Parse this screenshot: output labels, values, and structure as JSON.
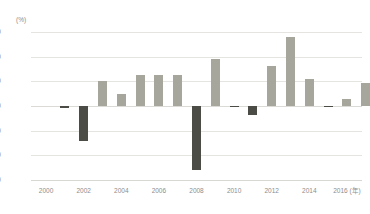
{
  "chart_data": {
    "type": "bar",
    "title": "",
    "subtitle": "",
    "xlabel": "(年)",
    "ylabel": "(%)",
    "ylim": [
      -60,
      60
    ],
    "yticks": [
      60,
      40,
      20,
      0,
      -20,
      -40,
      -60
    ],
    "ytick_labels": [
      "60",
      "40",
      "20",
      "0",
      "-20",
      "-40",
      "-60"
    ],
    "xticks": [
      "2000",
      "2002",
      "2004",
      "2006",
      "2008",
      "2010",
      "2012",
      "2014",
      "2016"
    ],
    "xtick_suffix": "(年)",
    "grid": true,
    "legend": "none",
    "categories": [
      "2000",
      "2001",
      "2002",
      "2003",
      "2004",
      "2005",
      "2006",
      "2007",
      "2008",
      "2009",
      "2010",
      "2011",
      "2012",
      "2013",
      "2014",
      "2015",
      "2016"
    ],
    "values": [
      0,
      -1.5,
      -28,
      20,
      10,
      25,
      25,
      25.5,
      -52,
      38,
      -1,
      -7.5,
      32.5,
      56,
      22,
      -0.5,
      6
    ],
    "values_extra": [
      19
    ],
    "colors": {
      "positive": "#a6a69c",
      "negative": "#4c4c46",
      "gridline": "#e6e4e0",
      "axis": "#d9d7d3",
      "tick_text": "#8d8d8d",
      "background": "#ffffff"
    }
  }
}
